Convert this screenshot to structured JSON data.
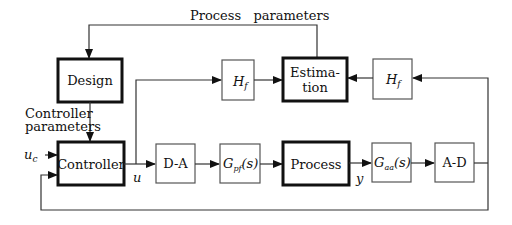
{
  "diagram": {
    "top_label": "Process   parameters",
    "side_label_line1": "Controller",
    "side_label_line2": "parameters",
    "blocks": {
      "design": "Design",
      "estimation_line1": "Estima-",
      "estimation_line2": "tion",
      "controller": "Controller",
      "process": "Process",
      "da": "D-A",
      "ad": "A-D",
      "hf_left": "H",
      "hf_left_sub": "f",
      "hf_right": "H",
      "hf_right_sub": "f",
      "gpf": "G",
      "gpf_sub": "pf",
      "gpf_arg": "(s)",
      "gaa": "G",
      "gaa_sub": "aa",
      "gaa_arg": "(s)"
    },
    "signals": {
      "uc": "u",
      "uc_sub": "c",
      "u": "u",
      "y": "y"
    },
    "colors": {
      "line": "#333333",
      "thick_border": "#111111",
      "thin_border": "#555555"
    }
  }
}
